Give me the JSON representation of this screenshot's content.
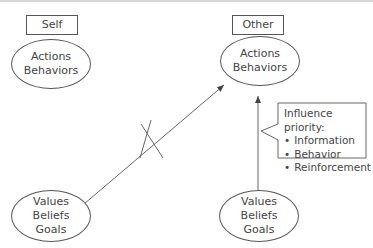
{
  "diagram": {
    "columns": {
      "self": {
        "label": "Self"
      },
      "other": {
        "label": "Other"
      }
    },
    "nodes": {
      "self_actions": {
        "lines": [
          "Actions",
          "Behaviors"
        ]
      },
      "self_values": {
        "lines": [
          "Values",
          "Beliefs",
          "Goals"
        ]
      },
      "other_actions": {
        "lines": [
          "Actions",
          "Behaviors"
        ]
      },
      "other_values": {
        "lines": [
          "Values",
          "Beliefs",
          "Goals"
        ]
      }
    },
    "edges": [
      {
        "from": "self_values",
        "to": "other_actions",
        "crossed_out": true
      },
      {
        "from": "other_values",
        "to": "other_actions",
        "crossed_out": false
      }
    ],
    "callout": {
      "title": "Influence priority:",
      "items": [
        "Information",
        "Behavior",
        "Reinforcement"
      ]
    },
    "colors": {
      "stroke": "#555555",
      "text": "#444444",
      "background": "#ffffff"
    }
  }
}
